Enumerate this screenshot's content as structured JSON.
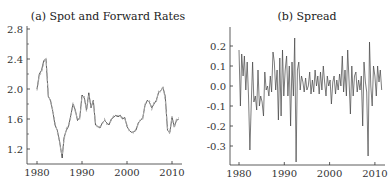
{
  "chart_data": [
    {
      "type": "line",
      "title": "(a) Spot and Forward Rates",
      "xlabel": "",
      "ylabel": "",
      "xlim": [
        1978,
        2012
      ],
      "ylim": [
        1.0,
        2.8
      ],
      "xticks": [
        "1980",
        "1990",
        "2000",
        "2010"
      ],
      "yticks": [
        "1.2",
        "1.6",
        "2.0",
        "2.4",
        "2.8"
      ],
      "grid": false,
      "legend": null,
      "series": [
        {
          "name": "Spot",
          "style": "solid-dark",
          "x": [
            1980,
            1980.5,
            1981,
            1981.5,
            1982,
            1982.5,
            1983,
            1983.5,
            1984,
            1984.5,
            1985,
            1985.3,
            1985.6,
            1986,
            1986.5,
            1987,
            1987.5,
            1988,
            1988.5,
            1989,
            1989.5,
            1990,
            1990.5,
            1991,
            1991.5,
            1992,
            1992.5,
            1993,
            1993.5,
            1994,
            1994.5,
            1995,
            1995.5,
            1996,
            1996.5,
            1997,
            1997.5,
            1998,
            1998.5,
            1999,
            1999.5,
            2000,
            2000.5,
            2001,
            2001.5,
            2002,
            2002.5,
            2003,
            2003.5,
            2004,
            2004.5,
            2005,
            2005.5,
            2006,
            2006.5,
            2007,
            2007.5,
            2008,
            2008.5,
            2009,
            2009.5,
            2010,
            2010.5,
            2011,
            2011.5
          ],
          "values": [
            2.0,
            2.2,
            2.25,
            2.38,
            2.4,
            1.9,
            1.85,
            1.7,
            1.52,
            1.45,
            1.3,
            1.2,
            1.08,
            1.35,
            1.45,
            1.5,
            1.65,
            1.8,
            1.72,
            1.58,
            1.62,
            1.92,
            1.88,
            1.72,
            1.95,
            1.75,
            1.85,
            1.52,
            1.5,
            1.48,
            1.55,
            1.58,
            1.55,
            1.52,
            1.6,
            1.62,
            1.65,
            1.63,
            1.65,
            1.6,
            1.62,
            1.5,
            1.45,
            1.42,
            1.43,
            1.45,
            1.55,
            1.58,
            1.62,
            1.78,
            1.85,
            1.82,
            1.75,
            1.8,
            1.85,
            1.95,
            1.98,
            2.02,
            1.9,
            1.45,
            1.42,
            1.62,
            1.5,
            1.58,
            1.6
          ]
        },
        {
          "name": "Forward",
          "style": "dashed-light",
          "x": [
            1980,
            1980.5,
            1981,
            1981.5,
            1982,
            1982.5,
            1983,
            1983.5,
            1984,
            1984.5,
            1985,
            1985.3,
            1985.6,
            1986,
            1986.5,
            1987,
            1987.5,
            1988,
            1988.5,
            1989,
            1989.5,
            1990,
            1990.5,
            1991,
            1991.5,
            1992,
            1992.5,
            1993,
            1993.5,
            1994,
            1994.5,
            1995,
            1995.5,
            1996,
            1996.5,
            1997,
            1997.5,
            1998,
            1998.5,
            1999,
            1999.5,
            2000,
            2000.5,
            2001,
            2001.5,
            2002,
            2002.5,
            2003,
            2003.5,
            2004,
            2004.5,
            2005,
            2005.5,
            2006,
            2006.5,
            2007,
            2007.5,
            2008,
            2008.5,
            2009,
            2009.5,
            2010,
            2010.5,
            2011,
            2011.5
          ],
          "values": [
            1.98,
            2.18,
            2.22,
            2.35,
            2.42,
            1.92,
            1.83,
            1.72,
            1.55,
            1.43,
            1.32,
            1.18,
            1.12,
            1.32,
            1.47,
            1.52,
            1.62,
            1.82,
            1.7,
            1.6,
            1.6,
            1.9,
            1.9,
            1.7,
            1.93,
            1.77,
            1.83,
            1.55,
            1.48,
            1.5,
            1.53,
            1.6,
            1.53,
            1.54,
            1.58,
            1.64,
            1.63,
            1.65,
            1.63,
            1.62,
            1.6,
            1.52,
            1.44,
            1.43,
            1.41,
            1.47,
            1.53,
            1.6,
            1.6,
            1.8,
            1.83,
            1.84,
            1.73,
            1.82,
            1.83,
            1.97,
            1.96,
            2.04,
            1.85,
            1.48,
            1.4,
            1.64,
            1.48,
            1.6,
            1.62
          ]
        }
      ]
    },
    {
      "type": "line",
      "title": "(b) Spread",
      "xlabel": "",
      "ylabel": "",
      "xlim": [
        1978.5,
        2012.5
      ],
      "ylim": [
        -0.4,
        0.3
      ],
      "xticks": [
        "1980",
        "1990",
        "2000",
        "2010"
      ],
      "yticks": [
        "-0.3",
        "-0.2",
        "-0.1",
        "0.0",
        "0.1",
        "0.2"
      ],
      "grid": false,
      "legend": null,
      "series": [
        {
          "name": "Spread",
          "x": [
            1980,
            1980.3,
            1980.6,
            1980.9,
            1981.2,
            1981.5,
            1981.8,
            1982.1,
            1982.4,
            1982.7,
            1983,
            1983.3,
            1983.6,
            1983.9,
            1984.2,
            1984.5,
            1984.8,
            1985.1,
            1985.4,
            1985.7,
            1986,
            1986.3,
            1986.6,
            1986.9,
            1987.2,
            1987.5,
            1987.8,
            1988.1,
            1988.4,
            1988.7,
            1989,
            1989.3,
            1989.6,
            1989.9,
            1990.2,
            1990.5,
            1990.8,
            1991.1,
            1991.4,
            1991.7,
            1992,
            1992.3,
            1992.6,
            1992.9,
            1993.2,
            1993.5,
            1993.8,
            1994.1,
            1994.4,
            1994.7,
            1995,
            1995.3,
            1995.6,
            1995.9,
            1996.2,
            1996.5,
            1996.8,
            1997.1,
            1997.4,
            1997.7,
            1998,
            1998.3,
            1998.6,
            1998.9,
            1999.2,
            1999.5,
            1999.8,
            2000.1,
            2000.4,
            2000.7,
            2001,
            2001.3,
            2001.6,
            2001.9,
            2002.2,
            2002.5,
            2002.8,
            2003.1,
            2003.4,
            2003.7,
            2004,
            2004.3,
            2004.6,
            2004.9,
            2005.2,
            2005.5,
            2005.8,
            2006.1,
            2006.4,
            2006.7,
            2007,
            2007.3,
            2007.6,
            2007.9,
            2008.2,
            2008.5,
            2008.8,
            2009.1,
            2009.4,
            2009.7,
            2010,
            2010.3,
            2010.6,
            2010.9,
            2011.2,
            2011.5
          ],
          "values": [
            0.18,
            -0.1,
            0.16,
            0.05,
            0.15,
            -0.02,
            0.12,
            -0.05,
            -0.32,
            -0.1,
            0.12,
            -0.08,
            -0.05,
            -0.12,
            0.08,
            -0.1,
            -0.05,
            -0.08,
            -0.15,
            0.07,
            -0.02,
            0.0,
            -0.05,
            0.05,
            -0.03,
            0.17,
            0.12,
            -0.02,
            0.08,
            -0.17,
            0.14,
            -0.15,
            0.18,
            -0.05,
            0.08,
            0.15,
            -0.05,
            0.1,
            -0.2,
            0.12,
            -0.05,
            0.24,
            -0.38,
            0.08,
            0.12,
            -0.02,
            0.05,
            0.02,
            -0.03,
            0.04,
            -0.02,
            0.0,
            0.07,
            -0.04,
            0.03,
            -0.03,
            0.08,
            0.0,
            0.05,
            -0.04,
            0.07,
            -0.02,
            0.1,
            0.02,
            -0.05,
            0.05,
            0.0,
            0.03,
            -0.09,
            0.02,
            0.05,
            -0.04,
            0.03,
            -0.02,
            0.06,
            0.0,
            0.15,
            -0.03,
            0.08,
            -0.05,
            0.18,
            0.02,
            -0.14,
            0.1,
            -0.05,
            0.05,
            0.07,
            -0.03,
            0.03,
            -0.02,
            0.05,
            -0.2,
            0.12,
            0.02,
            -0.03,
            -0.35,
            0.22,
            0.0,
            -0.1,
            0.1,
            0.05,
            -0.05,
            0.1,
            0.02,
            0.08,
            -0.02
          ]
        }
      ]
    }
  ]
}
